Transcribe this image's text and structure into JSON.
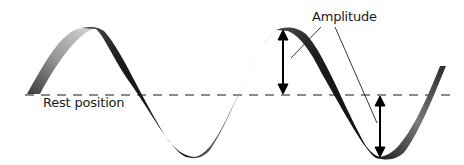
{
  "diagram": {
    "labels": {
      "amplitude": "Amplitude",
      "rest_position": "Rest position"
    },
    "colors": {
      "ribbon_dark": "#1e1e1e",
      "ribbon_light": "#cfcfcf",
      "rest_line": "#8a8a8a",
      "arrow": "#000000",
      "leader_line": "#222222",
      "background": "#ffffff"
    },
    "rest_line_y": 95,
    "wave_points": {
      "start": [
        30,
        94
      ],
      "peak_1": [
        85,
        28
      ],
      "crossing_1": [
        128,
        95
      ],
      "trough_1": [
        190,
        155
      ],
      "crossing_2": [
        232,
        95
      ],
      "peak_2": [
        287,
        30
      ],
      "crossing_3": [
        335,
        95
      ],
      "trough_2": [
        380,
        157
      ],
      "end": [
        442,
        68
      ]
    },
    "arrows": [
      {
        "name": "amplitude-arrow-peak",
        "x": 283,
        "y1": 31,
        "y2": 93
      },
      {
        "name": "amplitude-arrow-trough",
        "x": 380,
        "y1": 97,
        "y2": 156
      }
    ]
  }
}
